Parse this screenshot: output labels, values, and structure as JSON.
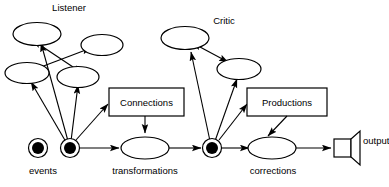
{
  "diagram": {
    "title": "",
    "type": "flow-diagram",
    "colors": {
      "stroke": "#000000",
      "fill": "#ffffff",
      "node_fill": "#000000"
    },
    "group_labels": {
      "listener": "Listener",
      "critic": "Critic"
    },
    "process_boxes": [
      {
        "id": "connections",
        "label": "Connections"
      },
      {
        "id": "productions",
        "label": "Productions"
      }
    ],
    "stream_labels": {
      "events": "events",
      "transformations": "transformations",
      "corrections": "corrections",
      "output": "output"
    },
    "icons": {
      "speaker": "speaker-icon",
      "event_node": "filled-ring-node-icon",
      "state_node": "filled-ring-node-icon"
    }
  }
}
